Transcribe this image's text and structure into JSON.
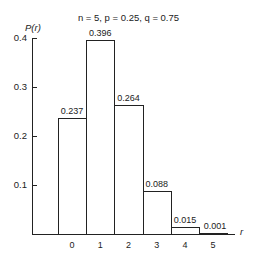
{
  "chart_data": {
    "type": "bar",
    "title": "n = 5, p = 0.25, q = 0.75",
    "xlabel": "r",
    "ylabel": "P(r)",
    "categories": [
      "0",
      "1",
      "2",
      "3",
      "4",
      "5"
    ],
    "values": [
      0.237,
      0.396,
      0.264,
      0.088,
      0.015,
      0.001
    ],
    "value_labels": [
      "0.237",
      "0.396",
      "0.264",
      "0.088",
      "0.015",
      "0.001"
    ],
    "yticks": [
      "0.1",
      "0.2",
      "0.3",
      "0.4"
    ],
    "ylim": [
      0,
      0.4
    ],
    "grid": false,
    "legend": null,
    "bar_color": "#ffffff",
    "edge_color": "#222222"
  }
}
